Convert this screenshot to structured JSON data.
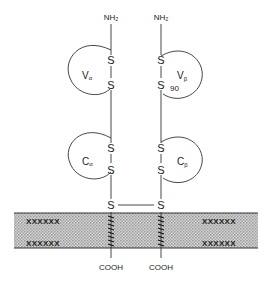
{
  "diagram": {
    "title": "",
    "chains": {
      "alpha": {
        "n_terminus": "NH₂",
        "c_terminus": "COOH",
        "variable_domain": {
          "label": "V",
          "sub": "α"
        },
        "constant_domain": {
          "label": "C",
          "sub": "α"
        },
        "disulfides": [
          "S",
          "S",
          "S",
          "S",
          "S"
        ]
      },
      "beta": {
        "n_terminus": "NH₂",
        "c_terminus": "COOH",
        "variable_domain": {
          "label": "V",
          "sub": "β"
        },
        "constant_domain": {
          "label": "C",
          "sub": "β"
        },
        "disulfides": [
          "S",
          "S",
          "S",
          "S",
          "S"
        ],
        "residue_number": "90"
      }
    },
    "interchain_bridge": {
      "left": "S",
      "right": "S"
    },
    "membrane": {
      "label": "lipid bilayer",
      "fill": "#bdbdbd"
    },
    "colors": {
      "line": "#333333",
      "text": "#222222"
    }
  }
}
